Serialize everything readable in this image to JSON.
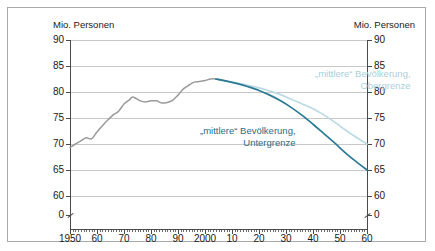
{
  "axis_unit_left": "Mio. Personen",
  "axis_unit_right": "Mio. Personen",
  "annotations": {
    "upper_line1": "„mittlere“ Bevölkerung,",
    "upper_line2": "Obergrenze",
    "lower_line1": "„mittlere“ Bevölkerung,",
    "lower_line2": "Untergrenze"
  },
  "colors": {
    "historical": "#9a9a9a",
    "upper_bound": "#bcd9e4",
    "lower_bound": "#2a7a96",
    "grid": "#c8c8c8",
    "axis": "#4a4a4a",
    "frame": "#a9a9a9"
  },
  "chart_data": {
    "type": "line",
    "title": "",
    "xlabel": "",
    "ylabel": "Mio. Personen",
    "xlim": [
      1950,
      2060
    ],
    "ylim": [
      60,
      90
    ],
    "y_axis_break_below": 60,
    "grid": true,
    "legend": "annotated-inline",
    "ytick_labels": [
      "0",
      "60",
      "65",
      "70",
      "75",
      "80",
      "85",
      "90"
    ],
    "ytick_values": [
      0,
      60,
      65,
      70,
      75,
      80,
      85,
      90
    ],
    "xtick_labels": [
      "1950",
      "60",
      "70",
      "80",
      "90",
      "2000",
      "10",
      "20",
      "30",
      "40",
      "50",
      "60"
    ],
    "xtick_values": [
      1950,
      1960,
      1970,
      1980,
      1990,
      2000,
      2010,
      2020,
      2030,
      2040,
      2050,
      2060
    ],
    "series": [
      {
        "name": "Historische Bevölkerung",
        "color": "#9a9a9a",
        "x": [
          1950,
          1952,
          1954,
          1956,
          1958,
          1960,
          1962,
          1964,
          1966,
          1968,
          1970,
          1972,
          1973,
          1974,
          1976,
          1978,
          1980,
          1982,
          1984,
          1986,
          1988,
          1990,
          1992,
          1994,
          1996,
          1998,
          2000,
          2002,
          2004,
          2006,
          2008
        ],
        "values": [
          69.3,
          70.0,
          70.6,
          71.2,
          71.0,
          72.3,
          73.5,
          74.6,
          75.6,
          76.3,
          77.7,
          78.5,
          79.0,
          78.9,
          78.3,
          78.1,
          78.3,
          78.3,
          77.9,
          78.0,
          78.4,
          79.4,
          80.6,
          81.3,
          81.9,
          82.0,
          82.2,
          82.5,
          82.5,
          82.3,
          82.1
        ]
      },
      {
        "name": "„mittlere“ Bevölkerung, Obergrenze",
        "color": "#bcd9e4",
        "x": [
          2008,
          2012,
          2016,
          2020,
          2024,
          2028,
          2032,
          2036,
          2040,
          2044,
          2048,
          2052,
          2056,
          2060
        ],
        "values": [
          82.1,
          81.7,
          81.3,
          80.8,
          80.2,
          79.5,
          78.6,
          77.7,
          76.8,
          75.6,
          74.2,
          72.7,
          71.3,
          70.0
        ]
      },
      {
        "name": "„mittlere“ Bevölkerung, Untergrenze",
        "color": "#2a7a96",
        "x": [
          2004,
          2008,
          2012,
          2016,
          2020,
          2024,
          2028,
          2032,
          2036,
          2040,
          2044,
          2048,
          2052,
          2056,
          2060
        ],
        "values": [
          82.5,
          82.1,
          81.6,
          81.0,
          80.3,
          79.4,
          78.3,
          77.0,
          75.5,
          73.8,
          72.0,
          70.2,
          68.3,
          66.6,
          65.0
        ]
      }
    ]
  }
}
